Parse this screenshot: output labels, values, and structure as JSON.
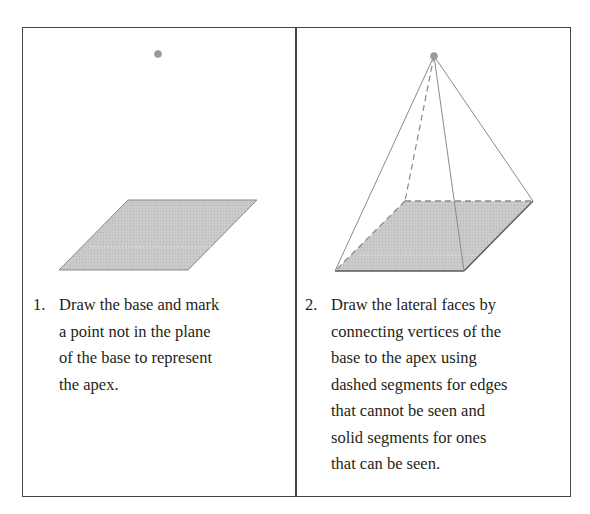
{
  "figure": {
    "panels": [
      {
        "id": "step-1",
        "number": "1.",
        "text": "Draw the base and mark\na point not in the plane\nof the base to represent\nthe apex.",
        "drawing": {
          "apex_point": [
            158,
            54
          ],
          "base": [
            [
              128,
              200
            ],
            [
              257,
              200
            ],
            [
              188,
              270
            ],
            [
              59,
              270
            ]
          ]
        }
      },
      {
        "id": "step-2",
        "number": "2.",
        "text": "Draw the lateral faces by\nconnecting vertices of the\nbase to the apex using\ndashed segments for edges\nthat cannot be seen and\nsolid segments for ones\nthat can be seen.",
        "drawing": {
          "apex_point": [
            434,
            56
          ],
          "base": [
            [
              405,
              201
            ],
            [
              533,
              201
            ],
            [
              464,
              271
            ],
            [
              335,
              271
            ]
          ],
          "hidden_edges": [
            "apex-backleft",
            "backleft-backright",
            "backleft-frontleft"
          ],
          "visible_edges": [
            "apex-frontleft",
            "apex-frontright",
            "apex-backright",
            "frontleft-frontright",
            "frontright-backright"
          ]
        }
      }
    ],
    "colors": {
      "base_fill": "#c8c8c8",
      "edge": "#777777",
      "apex": "#999999",
      "border": "#444444",
      "text": "#231f20"
    }
  }
}
